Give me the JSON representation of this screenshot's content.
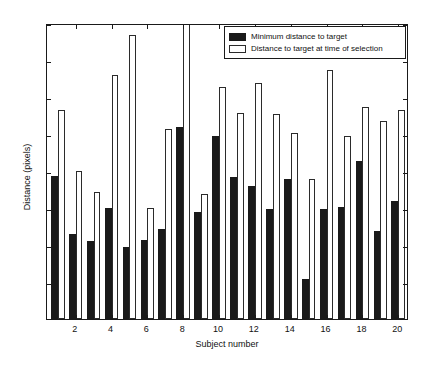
{
  "chart_data": {
    "type": "bar",
    "title": "",
    "xlabel": "Subject number",
    "ylabel": "Distance (pixels)",
    "ylim": [
      0,
      40
    ],
    "yticks": [
      0,
      5,
      10,
      15,
      20,
      25,
      30,
      35,
      40
    ],
    "xlim": [
      0.4,
      20.6
    ],
    "xticks": [
      2,
      4,
      6,
      8,
      10,
      12,
      14,
      16,
      18,
      20
    ],
    "xticklabels": [
      "2",
      "4",
      "6",
      "8",
      "10",
      "12",
      "14",
      "16",
      "18",
      "20"
    ],
    "grid": false,
    "legend_position": "upper right",
    "categories": [
      1,
      2,
      3,
      4,
      5,
      6,
      7,
      8,
      9,
      10,
      11,
      12,
      13,
      14,
      15,
      16,
      17,
      18,
      19,
      20
    ],
    "series": [
      {
        "name": "Minimum distance to target",
        "color": "#1a1a1a",
        "fill": "solid",
        "values": [
          19.3,
          11.5,
          10.5,
          15.0,
          9.7,
          10.7,
          12.2,
          25.9,
          14.4,
          24.7,
          19.2,
          18.0,
          14.9,
          18.9,
          5.4,
          14.9,
          15.2,
          21.4,
          11.9,
          15.9
        ]
      },
      {
        "name": "Distance to target at time of selection",
        "color": "#ffffff",
        "fill": "open",
        "values": [
          28.3,
          20.0,
          17.2,
          33.0,
          38.4,
          15.0,
          25.7,
          41.5,
          16.9,
          31.3,
          27.9,
          31.9,
          27.7,
          25.2,
          18.9,
          33.6,
          24.7,
          28.6,
          26.8,
          28.2
        ],
        "clipped_points": [
          {
            "category": 8,
            "note": "bar extends above axis limit of 40"
          }
        ]
      }
    ]
  },
  "legend": {
    "items": [
      {
        "label": "Minimum distance to target",
        "swatch": "dark"
      },
      {
        "label": "Distance to target at time of selection",
        "swatch": "light"
      }
    ]
  }
}
